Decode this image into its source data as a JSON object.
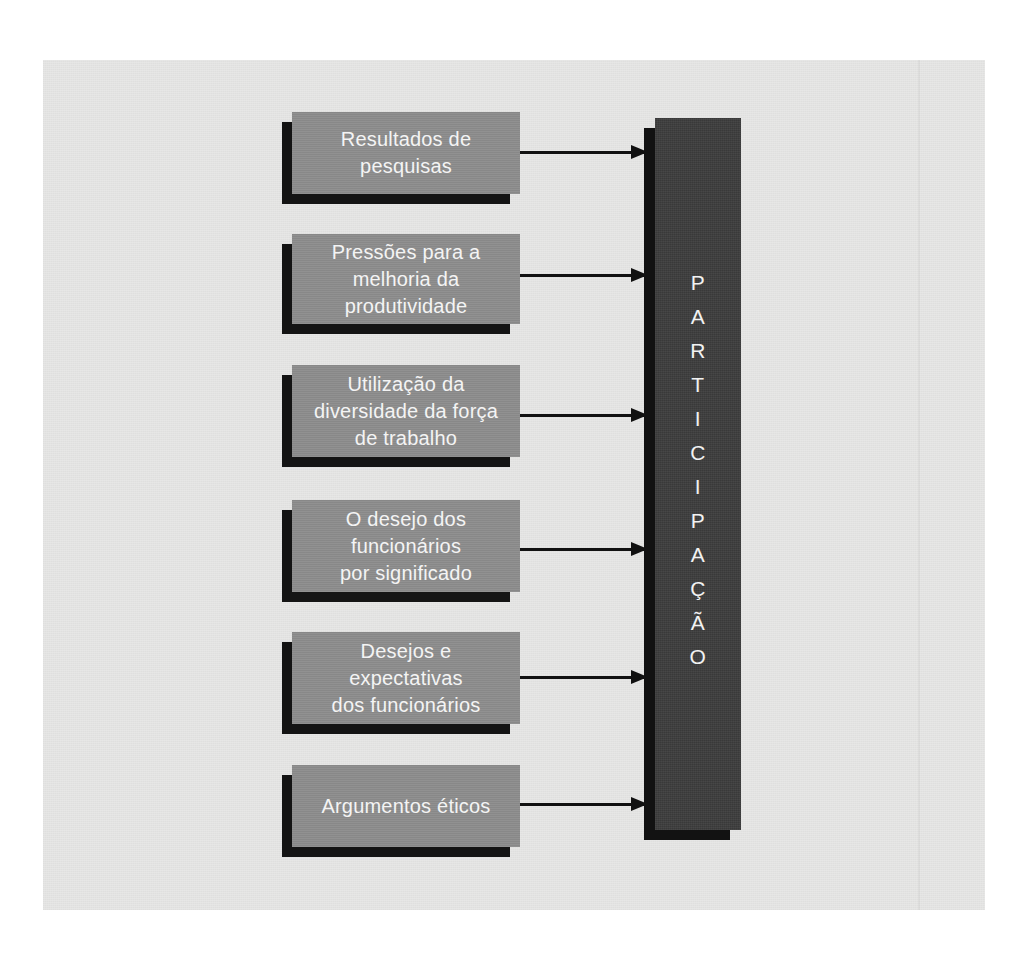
{
  "diagram": {
    "colors": {
      "page_background": "#ffffff",
      "panel_background": "#e7e7e6",
      "node_fill": "#8d8d8d",
      "node_text": "#f4f4f4",
      "shadow": "#141414",
      "target_fill": "#3d3d3d",
      "target_text": "#f2f2f2",
      "arrow": "#111111"
    },
    "nodes": [
      {
        "id": "node-1",
        "label": "Resultados de\npesquisas"
      },
      {
        "id": "node-2",
        "label": "Pressões para a\nmelhoria da\nprodutividade"
      },
      {
        "id": "node-3",
        "label": "Utilização da\ndiversidade da força\nde trabalho"
      },
      {
        "id": "node-4",
        "label": "O desejo dos\nfuncionários\npor significado"
      },
      {
        "id": "node-5",
        "label": "Desejos e\nexpectativas\ndos funcionários"
      },
      {
        "id": "node-6",
        "label": "Argumentos éticos"
      }
    ],
    "target": {
      "label": "PARTICIPAÇÃO",
      "letters": [
        "P",
        "A",
        "R",
        "T",
        "I",
        "C",
        "I",
        "P",
        "A",
        "Ç",
        "Ã",
        "O"
      ]
    },
    "connectors": [
      {
        "id": "arrow-1",
        "from": "node-1",
        "to": "target"
      },
      {
        "id": "arrow-2",
        "from": "node-2",
        "to": "target"
      },
      {
        "id": "arrow-3",
        "from": "node-3",
        "to": "target"
      },
      {
        "id": "arrow-4",
        "from": "node-4",
        "to": "target"
      },
      {
        "id": "arrow-5",
        "from": "node-5",
        "to": "target"
      },
      {
        "id": "arrow-6",
        "from": "node-6",
        "to": "target"
      }
    ]
  }
}
